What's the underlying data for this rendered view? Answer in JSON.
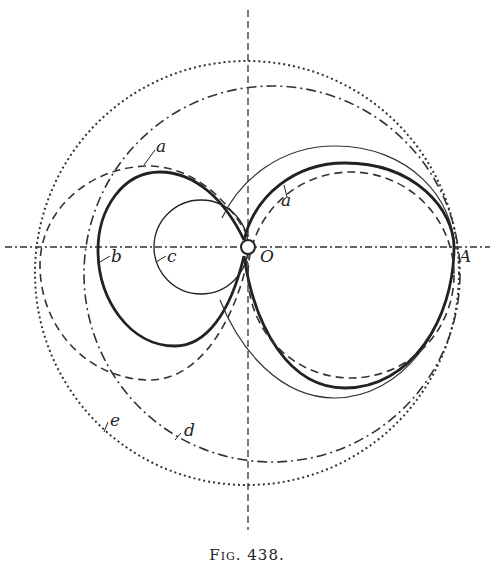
{
  "figure": {
    "caption": "Fig. 438.",
    "labels": {
      "O": "O",
      "A": "A",
      "a_left": "a",
      "a_right": "a",
      "b": "b",
      "c": "c",
      "d": "d",
      "e": "e"
    },
    "colors": {
      "ink": "#222222",
      "background": "#ffffff"
    },
    "geometry": {
      "origin_O": [
        248,
        247
      ],
      "point_A": [
        454,
        247
      ],
      "horizontal_axis_y": 247,
      "vertical_axis_x": 248,
      "curve_e_outer_dotted": {
        "center": [
          247,
          273
        ],
        "radius": 212
      },
      "curve_d_dashdot": {
        "center": [
          274,
          274
        ],
        "radius": 182
      },
      "curve_c_small_circle": {
        "center": [
          201,
          247
        ],
        "radius": 47
      },
      "curve_b_thick_loop": "inner loop of limacon through O",
      "curve_a_dashed": "limacon-type dashed curve"
    }
  }
}
